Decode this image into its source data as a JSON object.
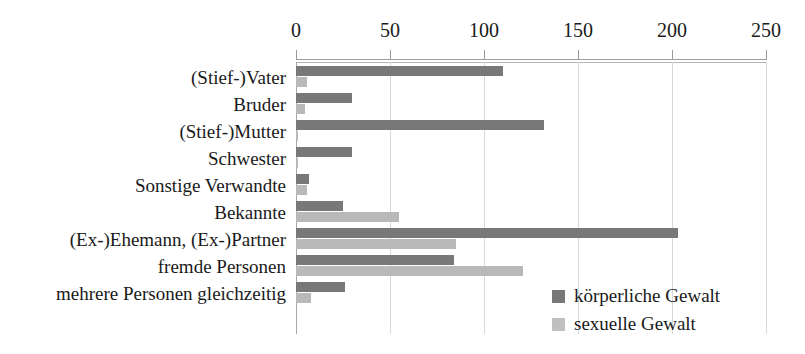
{
  "chart_data": {
    "type": "bar",
    "orientation": "horizontal",
    "title": "",
    "subtitle": "",
    "xlabel": "",
    "ylabel": "",
    "xlim": [
      0,
      250
    ],
    "xticks": [
      0,
      50,
      100,
      150,
      200,
      250
    ],
    "xtick_labels": [
      "0",
      "50",
      "100",
      "150",
      "200",
      "250"
    ],
    "grid": true,
    "grid_axis": "x",
    "legend_position": "inside-bottom-right",
    "categories": [
      "(Stief-)Vater",
      "Bruder",
      "(Stief-)Mutter",
      "Schwester",
      "Sonstige Verwandte",
      "Bekannte",
      "(Ex-)Ehemann, (Ex-)Partner",
      "fremde Personen",
      "mehrere Personen gleichzeitig"
    ],
    "series": [
      {
        "name": "körperliche Gewalt",
        "color": "#787878",
        "values": [
          110,
          30,
          132,
          30,
          7,
          25,
          203,
          84,
          26
        ]
      },
      {
        "name": "sexuelle Gewalt",
        "color": "#b9b9b9",
        "values": [
          6,
          5,
          1,
          1,
          6,
          55,
          85,
          121,
          8
        ]
      }
    ]
  },
  "legend": {
    "items": [
      {
        "label": "körperliche Gewalt",
        "swatch": "physical"
      },
      {
        "label": "sexuelle Gewalt",
        "swatch": "sexual"
      }
    ]
  },
  "colors": {
    "physical": "#787878",
    "sexual": "#b9b9b9",
    "grid": "#d8d8d8",
    "axis": "#9a9a9a",
    "text": "#1a1a1a",
    "background": "#ffffff"
  }
}
